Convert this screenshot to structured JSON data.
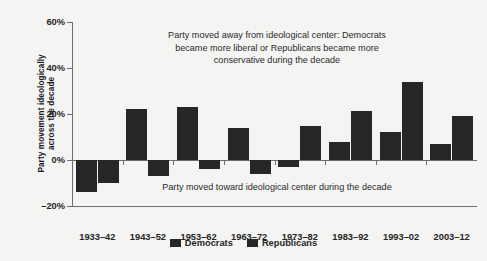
{
  "chart_data": {
    "type": "bar",
    "title": "",
    "subtitle": "",
    "xlabel": "",
    "ylabel": "Party movement ideologically across the decade",
    "ylabel_lines": [
      "Party movement ideologically",
      "across the decade"
    ],
    "categories": [
      "1933–42",
      "1943–52",
      "1953–62",
      "1963–72",
      "1973–82",
      "1983–92",
      "1993–02",
      "2003–12"
    ],
    "series": [
      {
        "name": "Democrats",
        "color": "#262626",
        "values": [
          -14,
          22,
          23,
          14,
          -3,
          8,
          12,
          7
        ]
      },
      {
        "name": "Republicans",
        "color": "#262626",
        "values": [
          -10,
          -7,
          -4,
          -6,
          15,
          21.5,
          34,
          19
        ]
      }
    ],
    "ylim": [
      -20,
      60
    ],
    "yticks": [
      -20,
      0,
      20,
      40,
      60
    ],
    "ytick_labels": [
      "–20%",
      "0%",
      "20%",
      "40%",
      "60%"
    ],
    "grid": false,
    "legend_position": "bottom",
    "annotations": [
      {
        "id": "above-center",
        "text": "Party moved away from ideological center: Democrats became more liberal or Republicans became more conservative during the decade",
        "lines": [
          "Party moved away from ideological center: Democrats",
          "became more liberal or Republicans became more",
          "conservative during the decade"
        ]
      },
      {
        "id": "below-center",
        "text": "Party moved toward ideological center during the decade",
        "lines": [
          "Party moved toward ideological center during the decade"
        ]
      }
    ]
  },
  "legend": {
    "items": [
      {
        "label": "Democrats"
      },
      {
        "label": "Republicans"
      }
    ]
  },
  "colors": {
    "bar": "#262626",
    "axis": "#6d6d6d",
    "background": "#f4f4f2",
    "text": "#1a1a1a"
  }
}
